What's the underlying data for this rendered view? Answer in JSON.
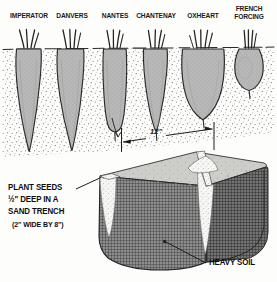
{
  "figure": {
    "title_alt": "Carrot varieties and sand trench planting diagram",
    "ground_line_label": "soil surface"
  },
  "varieties": [
    {
      "id": "imperator",
      "label": "IMPERATOR",
      "label_x": 29,
      "label_y": 14,
      "shape": "long-tapered",
      "root_cx": 29,
      "root_top": 48,
      "root_bottom": 150,
      "root_half_width": 13.5
    },
    {
      "id": "danvers",
      "label": "DANVERS",
      "label_x": 72,
      "label_y": 14,
      "shape": "long-tapered",
      "root_cx": 72,
      "root_top": 48,
      "root_bottom": 148,
      "root_half_width": 14.5
    },
    {
      "id": "nantes",
      "label": "NANTES",
      "label_x": 115,
      "label_y": 14,
      "shape": "cylindrical",
      "root_cx": 115,
      "root_top": 48,
      "root_bottom": 130,
      "root_half_width": 12.5
    },
    {
      "id": "chantenay",
      "label": "CHANTENAY",
      "label_x": 156,
      "label_y": 14,
      "shape": "conical",
      "root_cx": 156,
      "root_top": 48,
      "root_bottom": 128,
      "root_half_width": 12.5
    },
    {
      "id": "oxheart",
      "label": "OXHEART",
      "label_x": 203,
      "label_y": 14,
      "shape": "broad-conical",
      "root_cx": 203,
      "root_top": 48,
      "root_bottom": 116,
      "root_half_width": 21
    },
    {
      "id": "french-forcing",
      "label": "FRENCH",
      "label2": "FORCING",
      "label_x": 249,
      "label_y": 9,
      "shape": "round",
      "root_cx": 249,
      "root_top": 48,
      "root_bottom": 92,
      "root_half_width": 15
    }
  ],
  "dimension": {
    "value": "12\"",
    "x": 152,
    "y": 133
  },
  "callouts": {
    "plant_seeds": {
      "line1": "PLANT SEEDS",
      "line2_a": "½\"",
      "line2_b": " DEEP IN A",
      "line3": "SAND TRENCH",
      "line4": "(2\" WIDE BY 8\")",
      "x": 8,
      "y": 185
    },
    "heavy_soil": {
      "label": "HEAVY SOIL",
      "x": 210,
      "y": 262
    }
  },
  "colors": {
    "ink": "#1a1a1a",
    "root_fill": "#b4b4b4",
    "root_stroke": "#2b2b2b",
    "soil_block": "#6f6f6f",
    "soil_top": "#c9c9c6",
    "sand": "#f4f4f2",
    "stipple": "#555555",
    "paper": "#fdfdfb"
  }
}
